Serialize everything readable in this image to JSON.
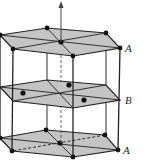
{
  "diagram": {
    "colors": {
      "plane_fill": "#c4c4c4",
      "edge": "#222222",
      "atom": "#111111",
      "axis": "#444444",
      "background": "#ffffff"
    },
    "labels": {
      "top_plane": "A",
      "middle_plane": "B",
      "bottom_plane": "A"
    },
    "layers": [
      {
        "name": "A-top",
        "label_key": "top_plane",
        "atoms": 7
      },
      {
        "name": "B-middle",
        "label_key": "middle_plane",
        "atoms": 3
      },
      {
        "name": "A-bottom",
        "label_key": "bottom_plane",
        "atoms": 7
      }
    ],
    "axis": "c-axis arrow (vertical, upward)"
  }
}
